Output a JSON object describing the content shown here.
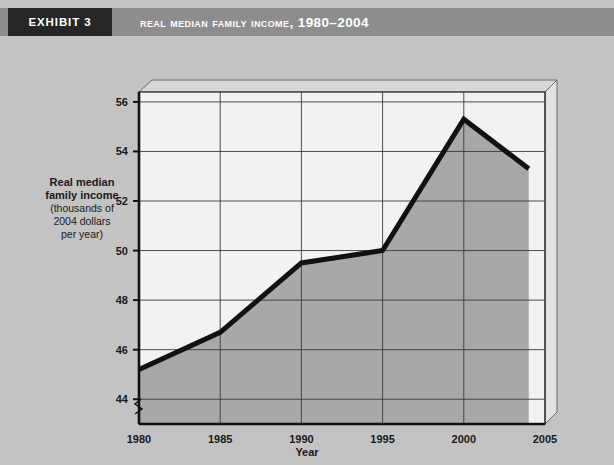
{
  "exhibit": {
    "tab_label": "EXHIBIT 3",
    "tab_bg": "#262626",
    "band_bg": "#8d8d8d"
  },
  "header": {
    "title": "Real Median Family Income, 1980–2004"
  },
  "axes": {
    "y_title_line1": "Real median",
    "y_title_line2": "family income",
    "y_sub_line1": "(thousands of",
    "y_sub_line2": "2004 dollars",
    "y_sub_line3": "per year)",
    "x_title": "Year",
    "y_break_symbol": "axis-break-zigzag"
  },
  "chart_data": {
    "type": "line",
    "title": "Real Median Family Income, 1980–2004",
    "xlabel": "Year",
    "ylabel": "Real median family income (thousands of 2004 dollars per year)",
    "x": [
      1980,
      1985,
      1990,
      1995,
      2000,
      2004
    ],
    "values": [
      45.2,
      46.7,
      49.5,
      50.0,
      55.3,
      53.3
    ],
    "xlim": [
      1980,
      2005
    ],
    "ylim": [
      43.0,
      56.4
    ],
    "xticks": [
      1980,
      1985,
      1990,
      1995,
      2000,
      2005
    ],
    "yticks": [
      44,
      46,
      48,
      50,
      52,
      54,
      56
    ],
    "xtick_labels": [
      "1980",
      "1985",
      "1990",
      "1995",
      "2000",
      "2005"
    ],
    "ytick_labels": [
      "44",
      "46",
      "48",
      "50",
      "52",
      "54",
      "56"
    ],
    "grid": true,
    "legend": "none",
    "area_fill": true,
    "line_color": "#111111",
    "area_color": "#a8a8a8",
    "plot_bg": "#f2f2f2",
    "axis_break": true
  }
}
